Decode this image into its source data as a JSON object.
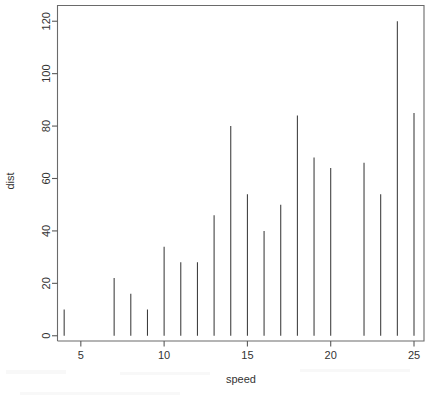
{
  "chart_data": {
    "type": "bar",
    "title": "",
    "subtitle": "",
    "xlabel": "speed",
    "ylabel": "dist",
    "xlim": [
      3.6,
      25.6
    ],
    "ylim": [
      -2,
      126
    ],
    "grid": false,
    "legend": null,
    "style": "spike-needle-plot",
    "x_ticks": [
      5,
      10,
      15,
      20,
      25
    ],
    "y_ticks": [
      0,
      20,
      40,
      60,
      80,
      100,
      120
    ],
    "x_tick_labels": [
      "5",
      "10",
      "15",
      "20",
      "25"
    ],
    "y_tick_labels": [
      "0",
      "20",
      "40",
      "60",
      "80",
      "100",
      "120"
    ],
    "series": [
      {
        "name": "dist",
        "x": [
          4,
          7,
          8,
          9,
          10,
          11,
          12,
          13,
          14,
          15,
          16,
          17,
          18,
          19,
          20,
          22,
          23,
          24,
          25
        ],
        "values": [
          10,
          22,
          16,
          10,
          34,
          28,
          28,
          46,
          80,
          54,
          40,
          50,
          84,
          68,
          64,
          66,
          54,
          120,
          85
        ]
      }
    ],
    "points": [
      {
        "speed": 4,
        "dist": 10
      },
      {
        "speed": 7,
        "dist": 22
      },
      {
        "speed": 8,
        "dist": 16
      },
      {
        "speed": 9,
        "dist": 10
      },
      {
        "speed": 10,
        "dist": 34
      },
      {
        "speed": 11,
        "dist": 28
      },
      {
        "speed": 12,
        "dist": 28
      },
      {
        "speed": 13,
        "dist": 46
      },
      {
        "speed": 14,
        "dist": 80
      },
      {
        "speed": 15,
        "dist": 54
      },
      {
        "speed": 16,
        "dist": 40
      },
      {
        "speed": 17,
        "dist": 50
      },
      {
        "speed": 18,
        "dist": 84
      },
      {
        "speed": 19,
        "dist": 68
      },
      {
        "speed": 20,
        "dist": 64
      },
      {
        "speed": 22,
        "dist": 66
      },
      {
        "speed": 23,
        "dist": 54
      },
      {
        "speed": 24,
        "dist": 120
      },
      {
        "speed": 25,
        "dist": 85
      }
    ],
    "colors": {
      "spike": "#3a3a3a",
      "axis": "#5a5a5a",
      "background": "#ffffff",
      "text": "#333333"
    }
  },
  "axes": {
    "x_title": "speed",
    "y_title": "dist"
  }
}
